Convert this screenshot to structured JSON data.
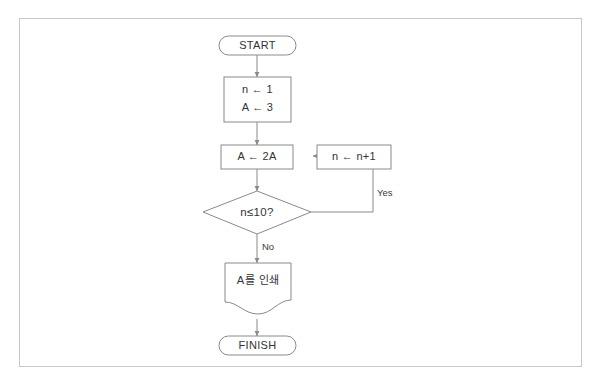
{
  "page": {
    "background_color": "#ffffff",
    "frame_border_color": "#c8c8c8",
    "shape_stroke_color": "#8a8a8a",
    "text_color": "#333333"
  },
  "flowchart": {
    "nodes": [
      {
        "id": "start",
        "type": "terminator",
        "label": "START"
      },
      {
        "id": "init",
        "type": "process",
        "label_line1": "n ← 1",
        "label_line2": "A ← 3"
      },
      {
        "id": "double",
        "type": "process",
        "label": "A ← 2A"
      },
      {
        "id": "incr",
        "type": "process",
        "label": "n ← n+1"
      },
      {
        "id": "decision",
        "type": "decision",
        "label": "n≤10?"
      },
      {
        "id": "print",
        "type": "document",
        "label": "A를 인쇄"
      },
      {
        "id": "finish",
        "type": "terminator",
        "label": "FINISH"
      }
    ],
    "edge_labels": {
      "yes": "Yes",
      "no": "No"
    }
  }
}
